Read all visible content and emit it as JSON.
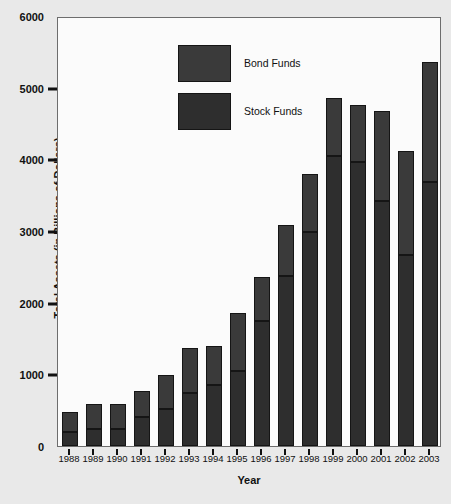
{
  "chart_data": {
    "type": "bar",
    "stacked": true,
    "title": "",
    "xlabel": "Year",
    "ylabel": "Total Assets (in Billions of Dollars)",
    "ylim": [
      0,
      6000
    ],
    "yticks": [
      0,
      1000,
      2000,
      3000,
      4000,
      5000,
      6000
    ],
    "ytick_labels": [
      "0",
      "1000",
      "2000",
      "3000",
      "4000",
      "5000",
      "6000"
    ],
    "grid": false,
    "legend_position": "upper-left-inside",
    "categories": [
      "1988",
      "1989",
      "1990",
      "1991",
      "1992",
      "1993",
      "1994",
      "1995",
      "1996",
      "1997",
      "1998",
      "1999",
      "2000",
      "2001",
      "2002",
      "2003"
    ],
    "series": [
      {
        "name": "Stock Funds",
        "color": "#2e2e2e",
        "values": [
          195,
          240,
          240,
          400,
          520,
          740,
          850,
          1050,
          1750,
          2370,
          2980,
          4040,
          3960,
          3420,
          2660,
          3680
        ]
      },
      {
        "name": "Bond Funds",
        "color": "#3a3a3a",
        "values": [
          275,
          340,
          340,
          370,
          470,
          630,
          540,
          800,
          610,
          710,
          810,
          810,
          800,
          1250,
          1450,
          1680
        ]
      }
    ],
    "totals": [
      470,
      580,
      580,
      770,
      990,
      1370,
      1390,
      1850,
      2360,
      3080,
      3790,
      4850,
      4760,
      4670,
      4110,
      5360
    ]
  },
  "legend": {
    "items": [
      {
        "label": "Bond Funds",
        "color": "#3a3a3a"
      },
      {
        "label": "Stock Funds",
        "color": "#2e2e2e"
      }
    ]
  }
}
